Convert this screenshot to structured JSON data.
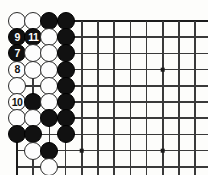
{
  "board": {
    "type": "go-board",
    "title": "Go problem diagram",
    "grid": {
      "cols": 12,
      "rows": 10,
      "spacing": 16.2,
      "origin_x": 17,
      "origin_y": 21,
      "col_x": [
        17,
        33.2,
        49.4,
        65.6,
        81.8,
        98,
        114.2,
        130.4,
        146.6,
        162.8,
        179,
        195.2
      ],
      "row_y": [
        21,
        37.2,
        53.4,
        69.6,
        85.8,
        102,
        118.2,
        134.4,
        150.6,
        166.8
      ],
      "top_edge_row": 0,
      "left_edge_col": 0,
      "edges": [
        "top",
        "left"
      ]
    },
    "star_points": [
      {
        "col": 9,
        "row": 3
      },
      {
        "col": 9,
        "row": 8
      },
      {
        "col": 4,
        "row": 8
      }
    ],
    "stones": [
      {
        "col": 0,
        "row": 0,
        "color": "white",
        "label": ""
      },
      {
        "col": 1,
        "row": 0,
        "color": "white",
        "label": ""
      },
      {
        "col": 2,
        "row": 0,
        "color": "black",
        "label": ""
      },
      {
        "col": 3,
        "row": 0,
        "color": "black",
        "label": ""
      },
      {
        "col": 0,
        "row": 1,
        "color": "black",
        "label": "9"
      },
      {
        "col": 1,
        "row": 1,
        "color": "black",
        "label": "11"
      },
      {
        "col": 2,
        "row": 1,
        "color": "white",
        "label": ""
      },
      {
        "col": 3,
        "row": 1,
        "color": "black",
        "label": ""
      },
      {
        "col": 0,
        "row": 2,
        "color": "black",
        "label": "7"
      },
      {
        "col": 1,
        "row": 2,
        "color": "white",
        "label": ""
      },
      {
        "col": 2,
        "row": 2,
        "color": "white",
        "label": ""
      },
      {
        "col": 3,
        "row": 2,
        "color": "black",
        "label": ""
      },
      {
        "col": 0,
        "row": 3,
        "color": "white",
        "label": "8"
      },
      {
        "col": 1,
        "row": 3,
        "color": "white",
        "label": ""
      },
      {
        "col": 2,
        "row": 3,
        "color": "white",
        "label": ""
      },
      {
        "col": 3,
        "row": 3,
        "color": "black",
        "label": ""
      },
      {
        "col": 0,
        "row": 4,
        "color": "white",
        "label": ""
      },
      {
        "col": 2,
        "row": 4,
        "color": "white",
        "label": ""
      },
      {
        "col": 3,
        "row": 4,
        "color": "black",
        "label": ""
      },
      {
        "col": 0,
        "row": 5,
        "color": "white",
        "label": "10"
      },
      {
        "col": 1,
        "row": 5,
        "color": "black",
        "label": ""
      },
      {
        "col": 2,
        "row": 5,
        "color": "white",
        "label": ""
      },
      {
        "col": 3,
        "row": 5,
        "color": "black",
        "label": ""
      },
      {
        "col": 0,
        "row": 6,
        "color": "white",
        "label": ""
      },
      {
        "col": 1,
        "row": 6,
        "color": "white",
        "label": ""
      },
      {
        "col": 2,
        "row": 6,
        "color": "black",
        "label": ""
      },
      {
        "col": 3,
        "row": 6,
        "color": "black",
        "label": ""
      },
      {
        "col": 0,
        "row": 7,
        "color": "black",
        "label": ""
      },
      {
        "col": 1,
        "row": 7,
        "color": "black",
        "label": ""
      },
      {
        "col": 3,
        "row": 7,
        "color": "black",
        "label": ""
      },
      {
        "col": 1,
        "row": 8,
        "color": "white",
        "label": ""
      },
      {
        "col": 2,
        "row": 8,
        "color": "black",
        "label": ""
      },
      {
        "col": 2,
        "row": 9,
        "color": "white",
        "label": ""
      }
    ],
    "move_labels": [
      "7",
      "8",
      "9",
      "10",
      "11"
    ],
    "colors": {
      "black_stone": "#111111",
      "white_stone": "#fdfdfd",
      "stone_outline": "#2b2b2b",
      "grid_line": "#3a3a3a",
      "edge_line": "#1c1c1c",
      "background": "#fdfdfb"
    }
  }
}
